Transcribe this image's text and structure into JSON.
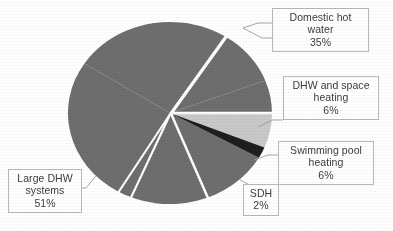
{
  "background_color": "#ffffff",
  "chart_data": {
    "type": "pie",
    "title": "",
    "subtitle": "",
    "xlabel": "",
    "ylabel": "",
    "legend_position": "callout-labels",
    "grid": false,
    "value_unit": "%",
    "categories": [
      "Domestic hot water",
      "DHW and space heating",
      "Swimming pool heating",
      "SDH",
      "Large DHW systems"
    ],
    "values": [
      35,
      6,
      6,
      2,
      51
    ],
    "colors": [
      "#6e6e6e",
      "#6e6e6e",
      "#c9c9c9",
      "#1e1e1e",
      "#6e6e6e"
    ],
    "slices": [
      {
        "label": "Domestic hot water",
        "value": 35,
        "value_text": "35%",
        "color": "#6e6e6e",
        "start_angle_deg": -57,
        "end_angle_deg": 69
      },
      {
        "label": "DHW and space heating",
        "value": 6,
        "value_text": "6%",
        "color": "#6e6e6e",
        "start_angle_deg": 69,
        "end_angle_deg": 91
      },
      {
        "label": "Swimming pool heating",
        "value": 6,
        "value_text": "6%",
        "color": "#c9c9c9",
        "start_angle_deg": 91,
        "end_angle_deg": 113
      },
      {
        "label": "SDH",
        "value": 2,
        "value_text": "2%",
        "color": "#1e1e1e",
        "start_angle_deg": 113,
        "end_angle_deg": 120
      },
      {
        "label": "Large DHW systems",
        "value": 51,
        "value_text": "51%",
        "color": "#6e6e6e",
        "start_angle_deg": 120,
        "end_angle_deg": 303
      }
    ]
  },
  "callouts": {
    "domestic_hot_water": {
      "line1": "Domestic hot",
      "line2": "water",
      "percent": "35%"
    },
    "dhw_and_space_heating": {
      "line1": "DHW and space",
      "line2": "heating",
      "percent": "6%"
    },
    "swimming_pool_heating": {
      "line1": "Swimming pool",
      "line2": "heating",
      "percent": "6%"
    },
    "sdh": {
      "line1": "SDH",
      "percent": "2%"
    },
    "large_dhw_systems": {
      "line1": "Large DHW",
      "line2": "systems",
      "percent": "51%"
    }
  }
}
